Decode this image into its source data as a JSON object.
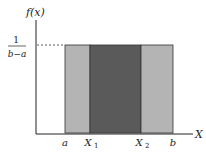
{
  "diagram": {
    "y_axis_label": "f(x)",
    "x_axis_label": "X",
    "density_label": {
      "numerator": "1",
      "denominator": "b−a"
    },
    "x_ticks": [
      {
        "label": "a",
        "sub": ""
      },
      {
        "label": "X",
        "sub": "1"
      },
      {
        "label": "X",
        "sub": "2"
      },
      {
        "label": "b",
        "sub": ""
      }
    ],
    "colors": {
      "outer_region": "#b4b4b4",
      "inner_region": "#5a5a5a",
      "axis": "#222222",
      "outline": "#333333"
    }
  }
}
